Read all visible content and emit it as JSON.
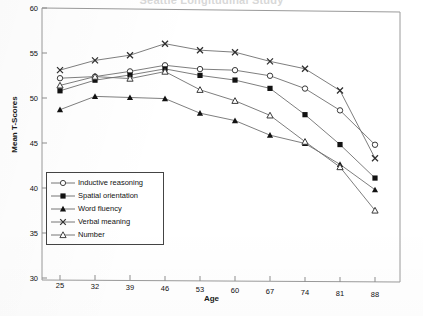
{
  "chart_data": {
    "type": "line",
    "title": "Seattle Longitudinal Study",
    "xlabel": "Age",
    "ylabel": "Mean T-Scores",
    "categories": [
      25,
      32,
      39,
      46,
      53,
      60,
      67,
      74,
      81,
      88
    ],
    "x_tick_labels": [
      "25",
      "32",
      "39",
      "46",
      "53",
      "60",
      "67",
      "74",
      "81",
      "88"
    ],
    "y_tick_labels": [
      "30",
      "35",
      "40",
      "45",
      "50",
      "55",
      "60"
    ],
    "y_ticks": [
      30,
      35,
      40,
      45,
      50,
      55,
      60
    ],
    "ylim": [
      30,
      60
    ],
    "xlim": [
      25,
      88
    ],
    "grid": false,
    "legend_position": "lower-left-inside",
    "series": [
      {
        "name": "Inductive reasoning",
        "marker": "open-circle",
        "values": [
          52.2,
          52.4,
          53.0,
          53.7,
          53.3,
          53.2,
          52.6,
          51.2,
          48.8,
          45.0
        ]
      },
      {
        "name": "Spatial orientation",
        "marker": "filled-square",
        "values": [
          50.8,
          52.0,
          52.6,
          53.3,
          52.6,
          52.1,
          51.2,
          48.3,
          45.0,
          41.3
        ]
      },
      {
        "name": "Word fluency",
        "marker": "filled-triangle",
        "values": [
          48.7,
          50.2,
          50.1,
          50.0,
          48.4,
          47.6,
          46.0,
          45.1,
          42.8,
          40.0
        ]
      },
      {
        "name": "Verbal meaning",
        "marker": "cross-x",
        "values": [
          53.1,
          54.2,
          54.8,
          56.1,
          55.4,
          55.2,
          54.2,
          53.4,
          51.0,
          43.5
        ]
      },
      {
        "name": "Number",
        "marker": "open-triangle",
        "values": [
          51.4,
          52.4,
          52.2,
          53.0,
          51.0,
          49.8,
          48.2,
          45.3,
          42.5,
          37.7
        ]
      }
    ]
  }
}
